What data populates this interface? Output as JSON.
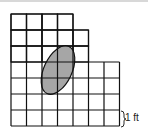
{
  "figure": {
    "grid": {
      "cell_size_label": "1 ft",
      "rows": [
        {
          "row": 1,
          "columns": 4
        },
        {
          "row": 2,
          "columns": 5
        },
        {
          "row": 3,
          "columns": 5
        },
        {
          "row": 4,
          "columns": 7
        },
        {
          "row": 5,
          "columns": 7
        },
        {
          "row": 6,
          "columns": 7
        },
        {
          "row": 7,
          "columns": 7
        }
      ]
    },
    "shaded_shape": "ellipse",
    "colors": {
      "grid": "#111111",
      "fill": "#a6a6a6",
      "background": "#ffffff"
    }
  }
}
